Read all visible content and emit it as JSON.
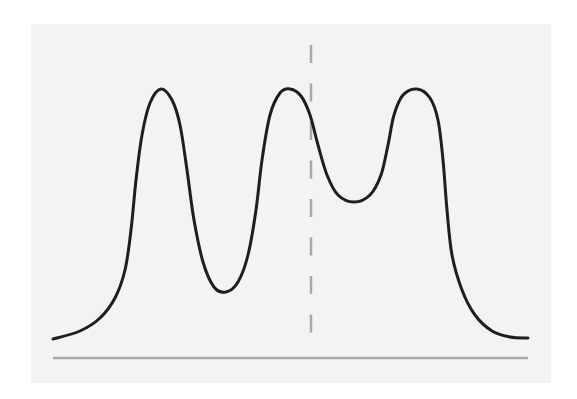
{
  "figure": {
    "background": "#ffffff",
    "panel_color": "#f3f3f3",
    "curve_color": "#1e1e1e",
    "dashed_line_color": "#a8a8a8",
    "baseline_color": "#a8a8a8"
  },
  "chart_data": {
    "type": "line",
    "title": "",
    "xlabel": "",
    "ylabel": "",
    "grid": false,
    "legend": null,
    "peaks": [
      {
        "x": 161,
        "y": 89
      },
      {
        "x": 290,
        "y": 89
      },
      {
        "x": 417,
        "y": 89
      }
    ],
    "troughs": [
      {
        "x": 226,
        "y": 292
      },
      {
        "x": 354,
        "y": 202
      }
    ],
    "reference_line": {
      "x": 311,
      "y_start": 45,
      "y_end": 337,
      "style": "dashed"
    },
    "baseline": {
      "y": 358,
      "x_start": 53,
      "x_end": 528
    },
    "series": [
      {
        "name": "density",
        "points": [
          [
            53,
            339
          ],
          [
            80,
            331
          ],
          [
            100,
            318
          ],
          [
            115,
            298
          ],
          [
            125,
            270
          ],
          [
            131,
            230
          ],
          [
            136,
            180
          ],
          [
            142,
            135
          ],
          [
            150,
            103
          ],
          [
            161,
            89
          ],
          [
            172,
            100
          ],
          [
            180,
            125
          ],
          [
            187,
            170
          ],
          [
            194,
            220
          ],
          [
            203,
            262
          ],
          [
            214,
            287
          ],
          [
            226,
            292
          ],
          [
            238,
            282
          ],
          [
            248,
            255
          ],
          [
            256,
            210
          ],
          [
            262,
            160
          ],
          [
            270,
            115
          ],
          [
            280,
            93
          ],
          [
            290,
            89
          ],
          [
            301,
            96
          ],
          [
            310,
            115
          ],
          [
            318,
            145
          ],
          [
            327,
            175
          ],
          [
            338,
            195
          ],
          [
            354,
            202
          ],
          [
            370,
            195
          ],
          [
            381,
            175
          ],
          [
            388,
            145
          ],
          [
            394,
            115
          ],
          [
            403,
            95
          ],
          [
            417,
            89
          ],
          [
            430,
            98
          ],
          [
            438,
            120
          ],
          [
            443,
            160
          ],
          [
            447,
            210
          ],
          [
            452,
            255
          ],
          [
            462,
            290
          ],
          [
            475,
            315
          ],
          [
            492,
            331
          ],
          [
            510,
            337
          ],
          [
            528,
            338
          ]
        ]
      }
    ]
  }
}
